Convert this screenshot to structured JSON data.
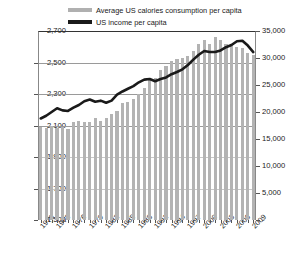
{
  "legend": {
    "items": [
      {
        "label": "Average US calories consumption per capita",
        "swatch": "bars",
        "color": "#b0b0b0"
      },
      {
        "label": "US income per capita",
        "swatch": "line",
        "color": "#1a1a1a"
      }
    ]
  },
  "axes": {
    "left_ticks": [
      "2,700",
      "2,500",
      "2,300",
      "2,100",
      "1,900",
      "1,700",
      "1,500"
    ],
    "right_ticks": [
      "35,000",
      "30,000",
      "25,000",
      "20,000",
      "15,000",
      "10,000",
      "5,000",
      "-"
    ],
    "x_ticks": [
      "1970",
      "1973",
      "1976",
      "1979",
      "1982",
      "1985",
      "1988",
      "1991",
      "1994",
      "1997",
      "2000",
      "2003",
      "2006",
      "2009"
    ]
  },
  "chart_data": {
    "type": "bar",
    "title": "",
    "subtitle": "",
    "xlabel": "",
    "ylabel": "",
    "grid": true,
    "legend_position": "top",
    "x": [
      1970,
      1971,
      1972,
      1973,
      1974,
      1975,
      1976,
      1977,
      1978,
      1979,
      1980,
      1981,
      1982,
      1983,
      1984,
      1985,
      1986,
      1987,
      1988,
      1989,
      1990,
      1991,
      1992,
      1993,
      1994,
      1995,
      1996,
      1997,
      1998,
      1999,
      2000,
      2001,
      2002,
      2003,
      2004,
      2005,
      2006,
      2007,
      2008,
      2009
    ],
    "categories": [
      "1970",
      "1971",
      "1972",
      "1973",
      "1974",
      "1975",
      "1976",
      "1977",
      "1978",
      "1979",
      "1980",
      "1981",
      "1982",
      "1983",
      "1984",
      "1985",
      "1986",
      "1987",
      "1988",
      "1989",
      "1990",
      "1991",
      "1992",
      "1993",
      "1994",
      "1995",
      "1996",
      "1997",
      "1998",
      "1999",
      "2000",
      "2001",
      "2002",
      "2003",
      "2004",
      "2005",
      "2006",
      "2007",
      "2008",
      "2009"
    ],
    "series": [
      {
        "name": "Average US calories consumption per capita",
        "type": "bar",
        "axis": "left",
        "color": "#b3b3b3",
        "ylim": [
          1500,
          2700
        ],
        "yticks": [
          1500,
          1700,
          1900,
          2100,
          2300,
          2500,
          2700
        ],
        "values": [
          2090,
          2085,
          2095,
          2085,
          2090,
          2080,
          2120,
          2130,
          2120,
          2125,
          2150,
          2130,
          2145,
          2175,
          2195,
          2240,
          2250,
          2270,
          2300,
          2340,
          2390,
          2400,
          2450,
          2480,
          2510,
          2520,
          2530,
          2540,
          2570,
          2620,
          2640,
          2620,
          2660,
          2640,
          2620,
          2610,
          2600,
          2590,
          2560,
          2550
        ]
      },
      {
        "name": "US income per capita",
        "type": "line",
        "axis": "right",
        "color": "#1a1a1a",
        "ylim": [
          0,
          35000
        ],
        "yticks": [
          0,
          5000,
          10000,
          15000,
          20000,
          25000,
          30000,
          35000
        ],
        "values": [
          18800,
          19300,
          20000,
          20700,
          20300,
          20200,
          20800,
          21300,
          22000,
          22300,
          21900,
          22100,
          21700,
          22100,
          23200,
          23800,
          24300,
          24800,
          25500,
          26000,
          26100,
          25700,
          26100,
          26400,
          27000,
          27400,
          27900,
          28700,
          29700,
          30600,
          31300,
          31100,
          31100,
          31400,
          32000,
          32400,
          33100,
          33200,
          32300,
          31100
        ]
      }
    ]
  }
}
